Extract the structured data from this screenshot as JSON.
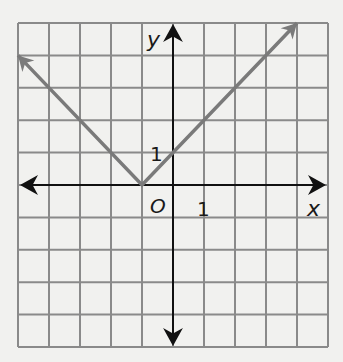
{
  "chart_data": {
    "type": "line",
    "title": "",
    "function": "y = |x + 1|",
    "xlabel": "x",
    "ylabel": "y",
    "origin_label": "O",
    "x_tick_label": "1",
    "y_tick_label": "1",
    "xlim": [
      -5,
      5
    ],
    "ylim": [
      -5,
      5
    ],
    "grid": true,
    "series": [
      {
        "name": "y = |x + 1|",
        "x": [
          -5,
          -1,
          4
        ],
        "y": [
          4,
          0,
          5
        ],
        "arrows": "both-ends",
        "color": "#7a7a7a"
      }
    ],
    "vertex": [
      -1,
      0
    ],
    "y_intercept": [
      0,
      1
    ]
  },
  "colors": {
    "background": "#f1f1ef",
    "grid": "#8a8a8a",
    "axes": "#111111",
    "curve": "#7a7a7a"
  }
}
